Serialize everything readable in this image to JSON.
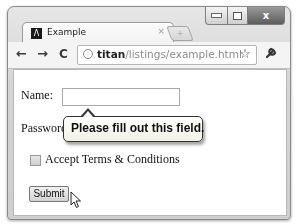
{
  "window": {
    "controls": {
      "minimize": "minimize",
      "maximize": "maximize",
      "close": "x"
    }
  },
  "tabs": [
    {
      "title": "Example",
      "favicon": "Λ",
      "close": "×",
      "active": true
    }
  ],
  "new_tab_glyph": "+",
  "toolbar": {
    "back": "←",
    "forward": "→",
    "reload": "C",
    "url_host": "titan",
    "url_path": "/listings/example.html",
    "bookmark_star": "☆",
    "wrench": "🔧"
  },
  "form": {
    "name_label": "Name:",
    "name_value": "",
    "password_label": "Password:",
    "accept_label": "Accept Terms & Conditions",
    "accept_checked": false,
    "submit_label": "Submit"
  },
  "validation_tooltip": {
    "message": "Please fill out this field."
  }
}
